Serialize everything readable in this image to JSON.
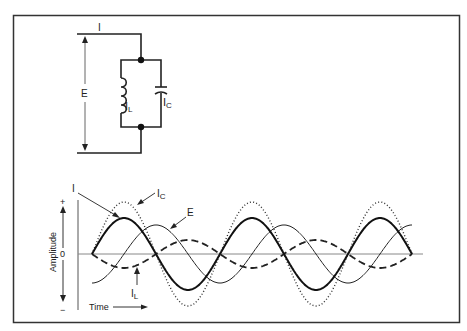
{
  "circuit": {
    "label_total_current": "I",
    "label_voltage": "E",
    "label_inductor_current": "I",
    "label_inductor_sub": "L",
    "label_capacitor_current": "I",
    "label_capacitor_sub": "C"
  },
  "graph": {
    "ylabel": "Amplitude",
    "y_plus": "+",
    "y_zero": "0",
    "y_minus": "−",
    "xlabel": "Time",
    "series_labels": {
      "I": "I",
      "E": "E",
      "IC": "I",
      "IC_sub": "C",
      "IL": "I",
      "IL_sub": "L"
    }
  },
  "chart_data": {
    "type": "line",
    "title": "",
    "xlabel": "Time",
    "ylabel": "Amplitude",
    "x_cycles": 2.5,
    "series": [
      {
        "name": "I",
        "style": "solid-thick",
        "amplitude": 36,
        "phase_deg": 0
      },
      {
        "name": "IC",
        "style": "dotted",
        "amplitude": 52,
        "phase_deg": 0
      },
      {
        "name": "E",
        "style": "solid-thin",
        "amplitude": 29,
        "phase_deg": -90
      },
      {
        "name": "IL",
        "style": "dashed",
        "amplitude": 14,
        "phase_deg": 180
      }
    ]
  }
}
